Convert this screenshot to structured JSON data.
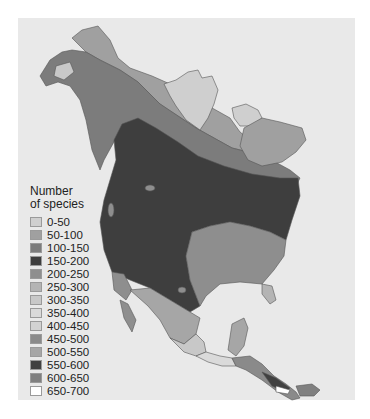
{
  "figure": {
    "type": "choropleth map",
    "region": "North America",
    "background_color": "#e9e9e9"
  },
  "legend": {
    "title_line1": "Number",
    "title_line2": "of species",
    "items": [
      {
        "label": "0-50",
        "color": "#cfcfcf"
      },
      {
        "label": "50-100",
        "color": "#a0a0a0"
      },
      {
        "label": "100-150",
        "color": "#7c7c7c"
      },
      {
        "label": "150-200",
        "color": "#3e3e3e"
      },
      {
        "label": "200-250",
        "color": "#8e8e8e"
      },
      {
        "label": "250-300",
        "color": "#b4b4b4"
      },
      {
        "label": "300-350",
        "color": "#c8c8c8"
      },
      {
        "label": "350-400",
        "color": "#dadada"
      },
      {
        "label": "400-450",
        "color": "#d2d2d2"
      },
      {
        "label": "450-500",
        "color": "#8a8a8a"
      },
      {
        "label": "500-550",
        "color": "#a6a6a6"
      },
      {
        "label": "550-600",
        "color": "#404040"
      },
      {
        "label": "600-650",
        "color": "#808080"
      },
      {
        "label": "650-700",
        "color": "#ffffff"
      }
    ]
  }
}
